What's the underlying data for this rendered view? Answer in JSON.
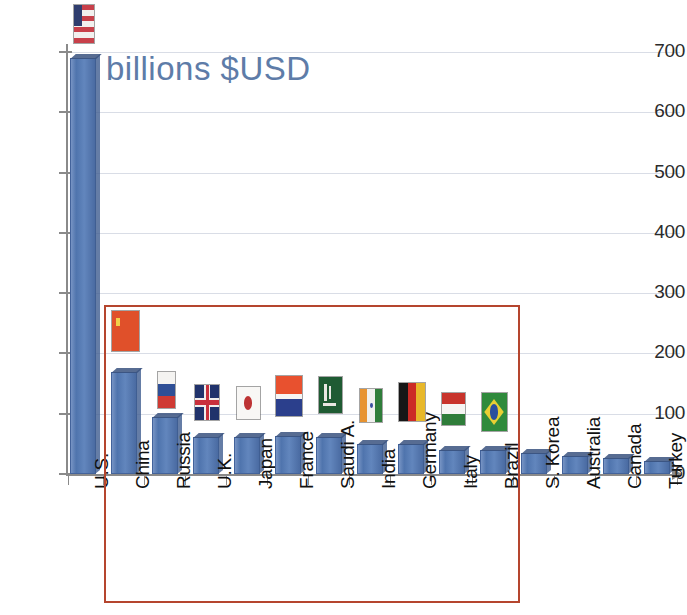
{
  "chart_data": {
    "type": "bar",
    "title": "billions $USD",
    "xlabel": "",
    "ylabel": "billions $USD",
    "ylim": [
      0,
      700
    ],
    "yticks": [
      0,
      100,
      200,
      300,
      400,
      500,
      600,
      700
    ],
    "grid": true,
    "legend": "none",
    "categories": [
      "U.S.",
      "China",
      "Russia",
      "U.K.",
      "Japan",
      "France",
      "Saudi A.",
      "India",
      "Germany",
      "Italy",
      "Brazil",
      "S. Korea",
      "Australia",
      "Canada",
      "Turkey"
    ],
    "values": [
      690,
      170,
      95,
      62,
      62,
      63,
      62,
      50,
      49,
      40,
      39,
      35,
      30,
      27,
      22
    ],
    "annotations": [
      {
        "name": "highlight-box",
        "note": "red rectangle enclosing China through Brazil"
      }
    ]
  },
  "axis": {
    "y_tick_labels": [
      "700",
      "600",
      "500",
      "400",
      "300",
      "200",
      "100",
      "0"
    ]
  },
  "flags": [
    {
      "country": "U.S.",
      "icon": "flag-us"
    },
    {
      "country": "China",
      "icon": "flag-china"
    },
    {
      "country": "Russia",
      "icon": "flag-russia"
    },
    {
      "country": "U.K.",
      "icon": "flag-uk"
    },
    {
      "country": "Japan",
      "icon": "flag-japan"
    },
    {
      "country": "France",
      "icon": "flag-france"
    },
    {
      "country": "Saudi A.",
      "icon": "flag-saudi-arabia"
    },
    {
      "country": "India",
      "icon": "flag-india"
    },
    {
      "country": "Germany",
      "icon": "flag-germany"
    },
    {
      "country": "Italy",
      "icon": "flag-italy"
    },
    {
      "country": "Brazil",
      "icon": "flag-brazil"
    },
    {
      "country": "S. Korea",
      "icon": "none"
    },
    {
      "country": "Australia",
      "icon": "none"
    },
    {
      "country": "Canada",
      "icon": "none"
    },
    {
      "country": "Turkey",
      "icon": "none"
    }
  ],
  "colors": {
    "bar": "#5B7FB5",
    "title": "#5E7CA8",
    "highlight_box": "#B5452E",
    "gridline": "#D9DDE6",
    "axis": "#8A8A8A"
  }
}
